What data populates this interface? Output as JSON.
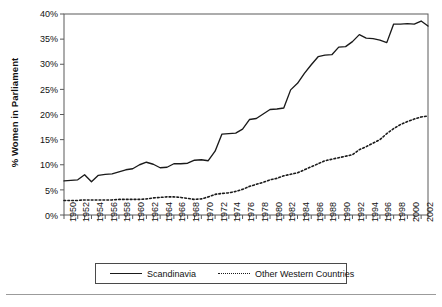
{
  "chart_data": {
    "type": "line",
    "title": "",
    "xlabel": "",
    "ylabel": "% Women in Parliament",
    "ylim": [
      0,
      40
    ],
    "xlim": [
      1950,
      2003
    ],
    "grid": false,
    "legend_position": "bottom",
    "y_ticks": [
      "0%",
      "5%",
      "10%",
      "15%",
      "20%",
      "25%",
      "30%",
      "35%",
      "40%"
    ],
    "y_tick_values": [
      0,
      5,
      10,
      15,
      20,
      25,
      30,
      35,
      40
    ],
    "x_tick_labels": [
      "1950",
      "1952",
      "1954",
      "1956",
      "1958",
      "1960",
      "1962",
      "1964",
      "1966",
      "1968",
      "1970",
      "1972",
      "1974",
      "1976",
      "1978",
      "1980",
      "1982",
      "1984",
      "1986",
      "1988",
      "1990",
      "1992",
      "1994",
      "1996",
      "1998",
      "2000",
      "2002"
    ],
    "x": [
      1950,
      1951,
      1952,
      1953,
      1954,
      1955,
      1956,
      1957,
      1958,
      1959,
      1960,
      1961,
      1962,
      1963,
      1964,
      1965,
      1966,
      1967,
      1968,
      1969,
      1970,
      1971,
      1972,
      1973,
      1974,
      1975,
      1976,
      1977,
      1978,
      1979,
      1980,
      1981,
      1982,
      1983,
      1984,
      1985,
      1986,
      1987,
      1988,
      1989,
      1990,
      1991,
      1992,
      1993,
      1994,
      1995,
      1996,
      1997,
      1998,
      1999,
      2000,
      2001,
      2002,
      2003
    ],
    "series": [
      {
        "name": "Scandinavia",
        "style": "solid",
        "color": "#1a1a1a",
        "values": [
          6.8,
          6.9,
          7.0,
          8.0,
          6.6,
          7.9,
          8.1,
          8.2,
          8.6,
          9.0,
          9.2,
          10.0,
          10.5,
          10.1,
          9.4,
          9.5,
          10.2,
          10.2,
          10.3,
          10.9,
          11.0,
          10.8,
          12.7,
          16.1,
          16.2,
          16.3,
          17.1,
          19.0,
          19.2,
          20.1,
          21.0,
          21.1,
          21.3,
          24.9,
          26.2,
          28.2,
          29.9,
          31.5,
          31.8,
          31.9,
          33.4,
          33.5,
          34.5,
          35.9,
          35.2,
          35.1,
          34.8,
          34.3,
          38.0,
          38.0,
          38.1,
          38.0,
          38.6,
          37.6
        ]
      },
      {
        "name": "Other Western Countries",
        "style": "dotted",
        "color": "#1a1a1a",
        "values": [
          2.9,
          2.9,
          2.9,
          3.0,
          3.0,
          3.0,
          3.0,
          3.0,
          3.1,
          3.1,
          3.1,
          3.1,
          3.2,
          3.4,
          3.5,
          3.6,
          3.6,
          3.5,
          3.3,
          3.1,
          3.2,
          3.6,
          4.1,
          4.3,
          4.4,
          4.7,
          5.1,
          5.7,
          6.1,
          6.5,
          7.0,
          7.3,
          7.8,
          8.1,
          8.4,
          9.0,
          9.6,
          10.2,
          10.8,
          11.1,
          11.4,
          11.7,
          12.0,
          13.0,
          13.6,
          14.3,
          15.0,
          16.2,
          17.2,
          18.0,
          18.6,
          19.1,
          19.5,
          19.7
        ]
      }
    ]
  },
  "legend": {
    "entries": [
      {
        "label": "Scandinavia"
      },
      {
        "label": "Other Western Countries"
      }
    ]
  }
}
